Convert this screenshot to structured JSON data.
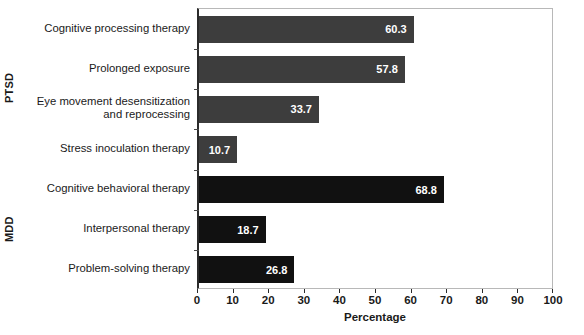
{
  "chart_data": {
    "type": "bar",
    "orientation": "horizontal",
    "title": "",
    "xlabel": "Percentage",
    "ylabel": "",
    "xlim": [
      0,
      100
    ],
    "xticks": [
      "0",
      "10",
      "20",
      "30",
      "40",
      "50",
      "60",
      "70",
      "80",
      "90",
      "100"
    ],
    "grid": false,
    "legend": null,
    "categories": [
      "Cognitive processing therapy",
      "Prolonged exposure",
      "Eye movement desensitization\nand reprocessing",
      "Stress inoculation therapy",
      "Cognitive behavioral therapy",
      "Interpersonal therapy",
      "Problem-solving therapy"
    ],
    "values": [
      60.3,
      57.8,
      33.7,
      10.7,
      68.8,
      18.7,
      26.8
    ],
    "value_labels": [
      "60.3",
      "57.8",
      "33.7",
      "10.7",
      "68.8",
      "18.7",
      "26.8"
    ],
    "groups": [
      {
        "label": "PTSD",
        "category_indices": [
          0,
          1,
          2,
          3
        ],
        "color": "#3d3d3d"
      },
      {
        "label": "MDD",
        "category_indices": [
          4,
          5,
          6
        ],
        "color": "#111111"
      }
    ],
    "colors": {
      "ptsd_bar": "#3d3d3d",
      "mdd_bar": "#111111",
      "value_label": "#ffffff",
      "axis": "#2b2b2b",
      "frame": "#b8b8b8",
      "background": "#ffffff",
      "text": "#1a1a1a"
    }
  },
  "bottom_caption": ""
}
